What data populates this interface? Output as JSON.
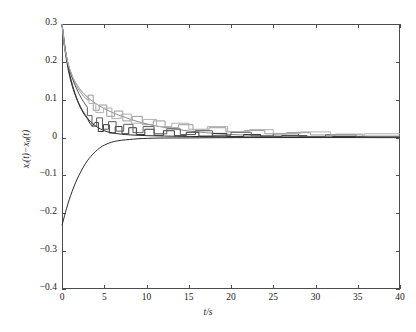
{
  "chart_data": {
    "type": "line",
    "title": "",
    "xlabel": "t/s",
    "ylabel_main": "x",
    "ylabel_sub1": "i",
    "ylabel_mid": "(t)−x",
    "ylabel_sub2": "0",
    "ylabel_end": "(t)",
    "ylabel_plain": "x_i(t)-x_0(t)",
    "xlim": [
      0,
      40
    ],
    "ylim": [
      -0.4,
      0.3
    ],
    "xticks": [
      0,
      5,
      10,
      15,
      20,
      25,
      30,
      35,
      40
    ],
    "yticks": [
      0.3,
      0.2,
      0.1,
      0,
      -0.1,
      -0.2,
      -0.3,
      -0.4
    ],
    "xticklabels": [
      "0",
      "5",
      "10",
      "15",
      "20",
      "25",
      "30",
      "35",
      "40"
    ],
    "yticklabels": [
      "0.3",
      "0.2",
      "0.1",
      "0",
      "−0.1",
      "−0.2",
      "−0.3",
      "−0.4"
    ],
    "grid": false,
    "legend": "none",
    "background": "#ffffff",
    "frame_color": "#4d4d4d",
    "series": [
      {
        "name": "error-1-smooth-dark",
        "color": "#2b2b2b",
        "width": 1.0,
        "style": "smooth",
        "points": [
          [
            0.0,
            0.3
          ],
          [
            0.12,
            0.282
          ],
          [
            0.25,
            0.258
          ],
          [
            0.4,
            0.232
          ],
          [
            0.6,
            0.202
          ],
          [
            0.85,
            0.173
          ],
          [
            1.1,
            0.15
          ],
          [
            1.4,
            0.126
          ],
          [
            1.7,
            0.106
          ],
          [
            2.0,
            0.09
          ],
          [
            2.4,
            0.072
          ],
          [
            2.8,
            0.058
          ],
          [
            3.2,
            0.046
          ],
          [
            3.6,
            0.037
          ],
          [
            4.0,
            0.03
          ],
          [
            4.6,
            0.022
          ],
          [
            5.2,
            0.016
          ],
          [
            6.0,
            0.012
          ],
          [
            7.0,
            0.009
          ],
          [
            8.0,
            0.007
          ],
          [
            10.0,
            0.005
          ],
          [
            12.0,
            0.004
          ],
          [
            15.0,
            0.003
          ],
          [
            20.0,
            0.002
          ],
          [
            25.0,
            0.001
          ],
          [
            30.0,
            0.001
          ],
          [
            35.0,
            0.0
          ],
          [
            40.0,
            0.0
          ]
        ]
      },
      {
        "name": "error-2-smooth-gray",
        "color": "#8c8c8c",
        "width": 1.0,
        "style": "smooth",
        "points": [
          [
            0.0,
            0.3
          ],
          [
            0.15,
            0.268
          ],
          [
            0.3,
            0.242
          ],
          [
            0.5,
            0.215
          ],
          [
            0.75,
            0.192
          ],
          [
            1.0,
            0.175
          ],
          [
            1.3,
            0.158
          ],
          [
            1.6,
            0.145
          ],
          [
            2.0,
            0.131
          ],
          [
            2.4,
            0.12
          ],
          [
            2.8,
            0.111
          ],
          [
            3.2,
            0.103
          ],
          [
            3.6,
            0.096
          ],
          [
            4.0,
            0.09
          ],
          [
            4.4,
            0.084
          ],
          [
            4.8,
            0.079
          ],
          [
            5.2,
            0.074
          ],
          [
            5.8,
            0.068
          ],
          [
            6.4,
            0.062
          ],
          [
            7.0,
            0.057
          ],
          [
            8.0,
            0.049
          ],
          [
            9.0,
            0.042
          ],
          [
            10.0,
            0.036
          ],
          [
            12.0,
            0.027
          ],
          [
            14.0,
            0.02
          ],
          [
            16.0,
            0.015
          ],
          [
            18.0,
            0.011
          ],
          [
            20.0,
            0.008
          ],
          [
            24.0,
            0.005
          ],
          [
            28.0,
            0.003
          ],
          [
            32.0,
            0.002
          ],
          [
            36.0,
            0.001
          ],
          [
            40.0,
            0.0
          ]
        ]
      },
      {
        "name": "error-3-smooth-negative",
        "color": "#2b2b2b",
        "width": 1.0,
        "style": "smooth",
        "points": [
          [
            0.0,
            -0.232
          ],
          [
            0.2,
            -0.215
          ],
          [
            0.4,
            -0.198
          ],
          [
            0.7,
            -0.175
          ],
          [
            1.0,
            -0.154
          ],
          [
            1.4,
            -0.13
          ],
          [
            1.8,
            -0.109
          ],
          [
            2.2,
            -0.091
          ],
          [
            2.6,
            -0.075
          ],
          [
            3.0,
            -0.061
          ],
          [
            3.4,
            -0.05
          ],
          [
            3.8,
            -0.04
          ],
          [
            4.2,
            -0.032
          ],
          [
            4.6,
            -0.025
          ],
          [
            5.0,
            -0.02
          ],
          [
            5.6,
            -0.014
          ],
          [
            6.2,
            -0.01
          ],
          [
            7.0,
            -0.007
          ],
          [
            8.0,
            -0.005
          ],
          [
            9.0,
            -0.003
          ],
          [
            10.0,
            -0.002
          ],
          [
            12.0,
            -0.001
          ],
          [
            15.0,
            -0.001
          ],
          [
            20.0,
            0.0
          ],
          [
            30.0,
            0.0
          ],
          [
            40.0,
            0.0
          ]
        ]
      },
      {
        "name": "error-4-staircase-dark",
        "color": "#333333",
        "width": 1.0,
        "style": "step",
        "points": [
          [
            0.0,
            0.3
          ],
          [
            0.2,
            0.255
          ],
          [
            0.45,
            0.215
          ],
          [
            0.75,
            0.178
          ],
          [
            1.05,
            0.148
          ],
          [
            1.4,
            0.122
          ],
          [
            1.8,
            0.098
          ],
          [
            2.2,
            0.078
          ],
          [
            2.6,
            0.062
          ],
          [
            3.0,
            0.05
          ],
          [
            3.3,
            0.038
          ],
          [
            3.6,
            0.03
          ],
          [
            3.9,
            0.04
          ],
          [
            4.3,
            0.04
          ],
          [
            4.3,
            0.016
          ],
          [
            4.9,
            0.016
          ],
          [
            4.9,
            0.034
          ],
          [
            5.6,
            0.034
          ],
          [
            5.6,
            0.012
          ],
          [
            6.3,
            0.012
          ],
          [
            6.3,
            0.029
          ],
          [
            7.1,
            0.029
          ],
          [
            7.1,
            0.01
          ],
          [
            7.9,
            0.01
          ],
          [
            7.9,
            0.026
          ],
          [
            8.8,
            0.026
          ],
          [
            8.8,
            0.008
          ],
          [
            9.8,
            0.008
          ],
          [
            9.8,
            0.022
          ],
          [
            10.9,
            0.022
          ],
          [
            10.9,
            0.006
          ],
          [
            12.0,
            0.006
          ],
          [
            12.0,
            0.018
          ],
          [
            13.3,
            0.018
          ],
          [
            13.3,
            0.005
          ],
          [
            14.7,
            0.005
          ],
          [
            14.7,
            0.014
          ],
          [
            16.2,
            0.014
          ],
          [
            16.2,
            0.004
          ],
          [
            17.8,
            0.004
          ],
          [
            17.8,
            0.011
          ],
          [
            19.5,
            0.011
          ],
          [
            19.5,
            0.003
          ],
          [
            21.5,
            0.003
          ],
          [
            21.5,
            0.008
          ],
          [
            23.5,
            0.008
          ],
          [
            23.5,
            0.002
          ],
          [
            26.0,
            0.002
          ],
          [
            26.0,
            0.005
          ],
          [
            29.0,
            0.005
          ],
          [
            29.0,
            0.001
          ],
          [
            32.0,
            0.001
          ],
          [
            32.0,
            0.003
          ],
          [
            36.0,
            0.003
          ],
          [
            36.0,
            0.001
          ],
          [
            40.0,
            0.001
          ]
        ]
      },
      {
        "name": "error-5-staircase-gray",
        "color": "#9a9a9a",
        "width": 1.0,
        "style": "step",
        "points": [
          [
            0.0,
            0.3
          ],
          [
            0.3,
            0.24
          ],
          [
            0.7,
            0.195
          ],
          [
            1.1,
            0.165
          ],
          [
            1.6,
            0.14
          ],
          [
            2.1,
            0.122
          ],
          [
            2.6,
            0.108
          ],
          [
            3.1,
            0.098
          ],
          [
            3.1,
            0.112
          ],
          [
            3.7,
            0.112
          ],
          [
            3.7,
            0.072
          ],
          [
            4.4,
            0.072
          ],
          [
            4.4,
            0.086
          ],
          [
            5.3,
            0.086
          ],
          [
            5.3,
            0.056
          ],
          [
            6.2,
            0.056
          ],
          [
            6.2,
            0.07
          ],
          [
            7.2,
            0.07
          ],
          [
            7.2,
            0.044
          ],
          [
            8.3,
            0.044
          ],
          [
            8.3,
            0.056
          ],
          [
            9.5,
            0.056
          ],
          [
            9.5,
            0.034
          ],
          [
            10.8,
            0.034
          ],
          [
            10.8,
            0.044
          ],
          [
            12.2,
            0.044
          ],
          [
            12.2,
            0.026
          ],
          [
            13.8,
            0.026
          ],
          [
            13.8,
            0.034
          ],
          [
            15.5,
            0.034
          ],
          [
            15.5,
            0.02
          ],
          [
            17.4,
            0.02
          ],
          [
            17.4,
            0.026
          ],
          [
            19.4,
            0.026
          ],
          [
            19.4,
            0.015
          ],
          [
            21.6,
            0.015
          ],
          [
            21.6,
            0.019
          ],
          [
            24.0,
            0.019
          ],
          [
            24.0,
            0.01
          ],
          [
            26.6,
            0.01
          ],
          [
            26.6,
            0.013
          ],
          [
            29.4,
            0.013
          ],
          [
            29.4,
            0.007
          ],
          [
            32.4,
            0.007
          ],
          [
            32.4,
            0.009
          ],
          [
            35.6,
            0.009
          ],
          [
            35.6,
            0.004
          ],
          [
            40.0,
            0.004
          ]
        ]
      },
      {
        "name": "error-6-staircase-mid",
        "color": "#5a5a5a",
        "width": 1.0,
        "style": "step",
        "points": [
          [
            0.0,
            0.3
          ],
          [
            0.25,
            0.248
          ],
          [
            0.6,
            0.205
          ],
          [
            1.0,
            0.17
          ],
          [
            1.5,
            0.14
          ],
          [
            2.0,
            0.116
          ],
          [
            2.5,
            0.096
          ],
          [
            3.0,
            0.08
          ],
          [
            3.0,
            0.058
          ],
          [
            3.55,
            0.058
          ],
          [
            3.55,
            0.03
          ],
          [
            4.1,
            0.03
          ],
          [
            4.1,
            0.052
          ],
          [
            4.8,
            0.052
          ],
          [
            4.8,
            0.022
          ],
          [
            5.5,
            0.022
          ],
          [
            5.5,
            0.042
          ],
          [
            6.4,
            0.042
          ],
          [
            6.4,
            0.017
          ],
          [
            7.3,
            0.017
          ],
          [
            7.3,
            0.035
          ],
          [
            8.4,
            0.035
          ],
          [
            8.4,
            0.013
          ],
          [
            9.6,
            0.013
          ],
          [
            9.6,
            0.029
          ],
          [
            10.9,
            0.029
          ],
          [
            10.9,
            0.01
          ],
          [
            12.4,
            0.01
          ],
          [
            12.4,
            0.023
          ],
          [
            14.0,
            0.023
          ],
          [
            14.0,
            0.008
          ],
          [
            15.8,
            0.008
          ],
          [
            15.8,
            0.018
          ],
          [
            17.8,
            0.018
          ],
          [
            17.8,
            0.006
          ],
          [
            20.0,
            0.006
          ],
          [
            20.0,
            0.014
          ],
          [
            22.4,
            0.014
          ],
          [
            22.4,
            0.004
          ],
          [
            25.0,
            0.004
          ],
          [
            25.0,
            0.01
          ],
          [
            28.0,
            0.01
          ],
          [
            28.0,
            0.003
          ],
          [
            31.2,
            0.003
          ],
          [
            31.2,
            0.007
          ],
          [
            34.8,
            0.007
          ],
          [
            34.8,
            0.002
          ],
          [
            40.0,
            0.002
          ]
        ]
      },
      {
        "name": "error-7-staircase-light",
        "color": "#b0b0b0",
        "width": 1.0,
        "style": "step",
        "points": [
          [
            0.0,
            0.3
          ],
          [
            0.35,
            0.232
          ],
          [
            0.8,
            0.188
          ],
          [
            1.3,
            0.158
          ],
          [
            1.9,
            0.134
          ],
          [
            2.5,
            0.117
          ],
          [
            3.2,
            0.104
          ],
          [
            3.2,
            0.09
          ],
          [
            4.0,
            0.09
          ],
          [
            4.0,
            0.066
          ],
          [
            4.9,
            0.066
          ],
          [
            4.9,
            0.078
          ],
          [
            5.9,
            0.078
          ],
          [
            5.9,
            0.05
          ],
          [
            7.0,
            0.05
          ],
          [
            7.0,
            0.062
          ],
          [
            8.2,
            0.062
          ],
          [
            8.2,
            0.038
          ],
          [
            9.6,
            0.038
          ],
          [
            9.6,
            0.048
          ],
          [
            11.2,
            0.048
          ],
          [
            11.2,
            0.029
          ],
          [
            13.0,
            0.029
          ],
          [
            13.0,
            0.038
          ],
          [
            15.0,
            0.038
          ],
          [
            15.0,
            0.022
          ],
          [
            17.2,
            0.022
          ],
          [
            17.2,
            0.029
          ],
          [
            19.6,
            0.029
          ],
          [
            19.6,
            0.016
          ],
          [
            22.2,
            0.016
          ],
          [
            22.2,
            0.021
          ],
          [
            25.0,
            0.021
          ],
          [
            25.0,
            0.011
          ],
          [
            28.2,
            0.011
          ],
          [
            28.2,
            0.015
          ],
          [
            31.8,
            0.015
          ],
          [
            31.8,
            0.007
          ],
          [
            35.8,
            0.007
          ],
          [
            35.8,
            0.01
          ],
          [
            40.0,
            0.01
          ]
        ]
      }
    ]
  },
  "plot_area": {
    "left": 62,
    "top": 24,
    "right": 400,
    "bottom": 289
  }
}
